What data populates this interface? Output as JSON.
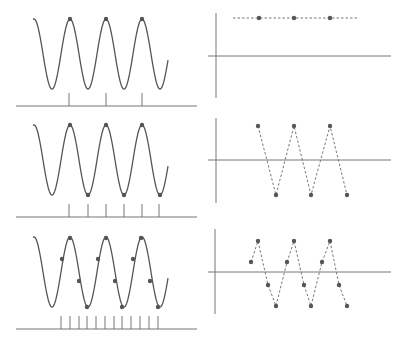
{
  "diagram": {
    "colors": {
      "curve": "#555555",
      "axis": "#777777",
      "dot": "#555555",
      "dashed": "#777777"
    },
    "sine": {
      "x_start": 33,
      "x_end": 168,
      "period": 36,
      "first_peak_x": 70,
      "amplitude": 35
    },
    "rows": [
      {
        "id": "row-1",
        "label": "1 sample per period",
        "left": {
          "center_y": 54,
          "baseline_y": 106,
          "tick_top_y": 93,
          "ticks_x": [
            69,
            106,
            142
          ],
          "dots": [
            [
              70,
              19
            ],
            [
              106,
              19
            ],
            [
              142,
              19
            ]
          ]
        },
        "right": {
          "axis_x": 216,
          "axis_y": 56,
          "v_top": 13,
          "v_bottom": 98,
          "h_left": 208,
          "h_right": 391,
          "dashed_extent": [
            233,
            358
          ],
          "points": [
            [
              259,
              18
            ],
            [
              294,
              18
            ],
            [
              330,
              18
            ]
          ]
        }
      },
      {
        "id": "row-2",
        "label": "2 samples per period",
        "left": {
          "center_y": 160,
          "baseline_y": 217,
          "tick_top_y": 204,
          "ticks_x": [
            69,
            88,
            106,
            124,
            142,
            159
          ],
          "dots": [
            [
              70,
              125
            ],
            [
              88,
              195
            ],
            [
              106,
              125
            ],
            [
              124,
              195
            ],
            [
              142,
              125
            ],
            [
              160,
              195
            ]
          ]
        },
        "right": {
          "axis_x": 216,
          "axis_y": 160,
          "v_top": 118,
          "v_bottom": 203,
          "h_left": 208,
          "h_right": 391,
          "points": [
            [
              258,
              126
            ],
            [
              276,
              195
            ],
            [
              294,
              126
            ],
            [
              311,
              195
            ],
            [
              330,
              126
            ],
            [
              347,
              195
            ]
          ]
        }
      },
      {
        "id": "row-3",
        "label": "4 samples per period",
        "left": {
          "center_y": 272,
          "baseline_y": 329,
          "tick_top_y": 316,
          "ticks_x": [
            61,
            70,
            79,
            87,
            96,
            105,
            114,
            122,
            131,
            140,
            149,
            158
          ],
          "dots": [
            [
              62,
              259
            ],
            [
              70,
              238
            ],
            [
              79,
              281
            ],
            [
              87,
              307
            ],
            [
              98,
              259
            ],
            [
              106,
              238
            ],
            [
              115,
              281
            ],
            [
              122,
              307
            ],
            [
              133,
              259
            ],
            [
              141,
              238
            ],
            [
              150,
              281
            ],
            [
              158,
              307
            ]
          ]
        },
        "right": {
          "axis_x": 215,
          "axis_y": 272,
          "v_top": 229,
          "v_bottom": 314,
          "h_left": 208,
          "h_right": 391,
          "points": [
            [
              251,
              262
            ],
            [
              258,
              241
            ],
            [
              268,
              285
            ],
            [
              276,
              306
            ],
            [
              287,
              262
            ],
            [
              294,
              241
            ],
            [
              304,
              285
            ],
            [
              311,
              306
            ],
            [
              322,
              262
            ],
            [
              330,
              241
            ],
            [
              339,
              285
            ],
            [
              347,
              306
            ]
          ]
        }
      }
    ],
    "baseline": {
      "x_start": 16,
      "x_end": 197
    }
  }
}
